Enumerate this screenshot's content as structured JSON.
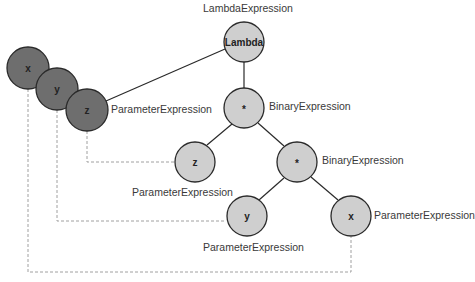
{
  "diagram": {
    "type": "expression-tree",
    "nodes": [
      {
        "id": "lambda",
        "text": "Lambda",
        "label": "LambdaExpression"
      },
      {
        "id": "mul1",
        "text": "*",
        "label": "BinaryExpression"
      },
      {
        "id": "z_ref",
        "text": "z",
        "label": "ParameterExpression"
      },
      {
        "id": "mul2",
        "text": "*",
        "label": "BinaryExpression"
      },
      {
        "id": "y_ref",
        "text": "y",
        "label": "ParameterExpression"
      },
      {
        "id": "x_ref",
        "text": "x",
        "label": "ParameterExpression"
      }
    ],
    "parameters": [
      {
        "id": "px",
        "text": "x"
      },
      {
        "id": "py",
        "text": "y"
      },
      {
        "id": "pz",
        "text": "z",
        "label": "ParameterExpression"
      }
    ],
    "colors": {
      "node_fill": "#cfcfcf",
      "param_fill": "#6e6e6e",
      "stroke": "#2a2a2a",
      "dash": "#9a9a9a"
    }
  }
}
